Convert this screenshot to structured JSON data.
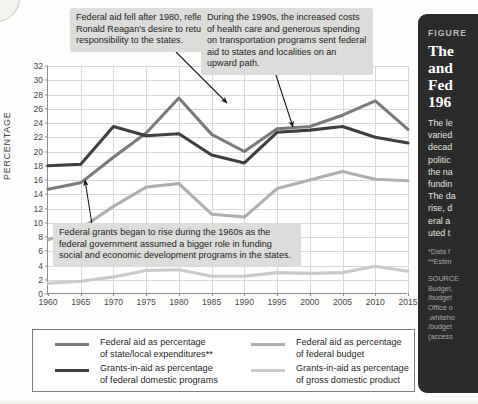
{
  "figure": {
    "kicker": "FIGURE",
    "title_lines": [
      "The",
      "and",
      "Fed",
      "196"
    ],
    "body_lines": [
      "The le",
      "varied",
      "decad",
      "politic",
      "the na",
      "fundin",
      "The da",
      "rise, d",
      "eral a",
      "uted t"
    ],
    "notes_lines": [
      "*Data f",
      "**Estim"
    ],
    "source_lines": [
      "SOURCE",
      "Budget,",
      "/budget",
      "Office o",
      ".whiteho",
      "/budget",
      "(access"
    ]
  },
  "chart_data": {
    "type": "line",
    "title": "",
    "xlabel": "",
    "ylabel": "PERCENTAGE",
    "xlim": [
      1960,
      2015
    ],
    "ylim": [
      0,
      32
    ],
    "ytick_step": 2,
    "xtick_step": 5,
    "grid": true,
    "legend_position": "bottom",
    "x": [
      1960,
      1965,
      1970,
      1975,
      1980,
      1985,
      1990,
      1995,
      2000,
      2005,
      2010,
      2015
    ],
    "yticks": [
      0,
      2,
      4,
      6,
      8,
      10,
      12,
      14,
      16,
      18,
      20,
      22,
      24,
      26,
      28,
      30,
      32
    ],
    "xticks": [
      1960,
      1965,
      1970,
      1975,
      1980,
      1985,
      1990,
      1995,
      2000,
      2005,
      2010,
      2015
    ],
    "series": [
      {
        "name": "Federal aid as percentage of state/local expenditures**",
        "color": "#7a7a78",
        "values": [
          14.7,
          15.6,
          19.2,
          22.6,
          27.5,
          22.4,
          20.0,
          23.2,
          23.5,
          25.1,
          27.1,
          23.1
        ]
      },
      {
        "name": "Grants-in-aid as percentage of federal domestic programs",
        "color": "#3f3f3d",
        "values": [
          18.0,
          18.2,
          23.5,
          22.2,
          22.5,
          19.5,
          18.4,
          22.7,
          23.0,
          23.5,
          22.0,
          21.2
        ]
      },
      {
        "name": "Federal aid as percentage of federal budget",
        "color": "#aeaeab",
        "values": [
          7.6,
          9.2,
          12.3,
          15.0,
          15.5,
          11.2,
          10.8,
          14.8,
          16.0,
          17.2,
          16.1,
          15.9
        ]
      },
      {
        "name": "Grants-in-aid as percentage of gross domestic product",
        "color": "#c9c9c6",
        "values": [
          1.5,
          1.8,
          2.4,
          3.3,
          3.4,
          2.5,
          2.5,
          3.0,
          2.9,
          3.0,
          3.9,
          3.2
        ]
      }
    ],
    "annotations": [
      {
        "id": "reagan",
        "text": "Federal aid fell after 1980, reflecting Ronald Reagan's desire to return more responsibility to the states.",
        "points_to_year": 1980
      },
      {
        "id": "nineties",
        "text": "During the 1990s, the increased costs of health care and generous spending on transportation programs sent federal aid to states and localities on an upward path.",
        "points_to_year": 1995
      },
      {
        "id": "sixties",
        "text": "Federal grants began to rise during the 1960s as the federal government assumed a bigger role in funding social and economic development programs in the states.",
        "points_to_year": 1965
      }
    ]
  },
  "legend": {
    "columns": [
      [
        {
          "label_line1": "Federal aid as percentage",
          "label_line2": "of state/local expenditures**",
          "color": "#7a7a78"
        },
        {
          "label_line1": "Grants-in-aid as percentage",
          "label_line2": "of federal domestic programs",
          "color": "#3f3f3d"
        }
      ],
      [
        {
          "label_line1": "Federal aid as percentage",
          "label_line2": "of federal budget",
          "color": "#aeaeab"
        },
        {
          "label_line1": "Grants-in-aid as percentage",
          "label_line2": "of gross domestic product",
          "color": "#c9c9c6"
        }
      ]
    ]
  }
}
